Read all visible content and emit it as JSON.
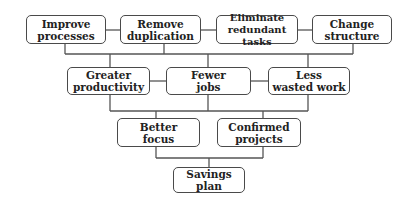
{
  "diagram": {
    "type": "hierarchy-flow",
    "colors": {
      "border": "#4a4a4a",
      "text": "#222222",
      "line": "#555555",
      "background": "#ffffff"
    },
    "row1": [
      {
        "line1": "Improve",
        "line2": "processes"
      },
      {
        "line1": "Remove",
        "line2": "duplication"
      },
      {
        "line1": "Eliminate",
        "line2": "redundant tasks"
      },
      {
        "line1": "Change",
        "line2": "structure"
      }
    ],
    "row2": [
      {
        "line1": "Greater",
        "line2": "productivity"
      },
      {
        "line1": "Fewer",
        "line2": "jobs"
      },
      {
        "line1": "Less",
        "line2": "wasted work"
      }
    ],
    "row3": [
      {
        "line1": "Better",
        "line2": "focus"
      },
      {
        "line1": "Confirmed",
        "line2": "projects"
      }
    ],
    "row4": [
      {
        "line1": "Savings plan"
      }
    ]
  }
}
